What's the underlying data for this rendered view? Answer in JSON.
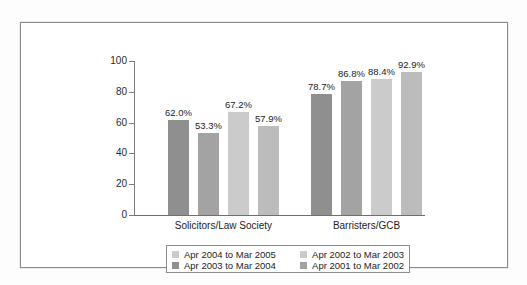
{
  "chart_data": {
    "type": "bar",
    "title": "",
    "xlabel": "",
    "ylabel": "",
    "ylim": [
      0,
      100
    ],
    "yticks": [
      "0",
      "20",
      "40",
      "60",
      "80",
      "100"
    ],
    "grid": false,
    "legend_position": "bottom",
    "categories": [
      "Solicitors/Law Society",
      "Barristers/GCB"
    ],
    "series": [
      {
        "name": "Apr 2004 to Mar 2005",
        "color": "#8f8f8f",
        "values": [
          62.0,
          78.7
        ],
        "labels": [
          "62.0%",
          "78.7%"
        ]
      },
      {
        "name": "Apr 2003 to Mar 2004",
        "color": "#a3a3a3",
        "values": [
          53.3,
          86.8
        ],
        "labels": [
          "53.3%",
          "86.8%"
        ]
      },
      {
        "name": "Apr 2002 to Mar 2003",
        "color": "#cbcbcb",
        "values": [
          67.2,
          88.4
        ],
        "labels": [
          "67.2%",
          "88.4%"
        ]
      },
      {
        "name": "Apr 2001 to Mar 2002",
        "color": "#bcbcbc",
        "values": [
          57.9,
          92.9
        ],
        "labels": [
          "57.9%",
          "92.9%"
        ]
      }
    ]
  },
  "legend": {
    "entries": [
      {
        "label": "Apr 2004 to Mar 2005",
        "color": "#cbcbcb"
      },
      {
        "label": "Apr 2002 to Mar 2003",
        "color": "#cbcbcb"
      },
      {
        "label": "Apr 2003 to Mar 2004",
        "color": "#8f8f8f"
      },
      {
        "label": "Apr 2001 to Mar 2002",
        "color": "#a3a3a3"
      }
    ]
  }
}
